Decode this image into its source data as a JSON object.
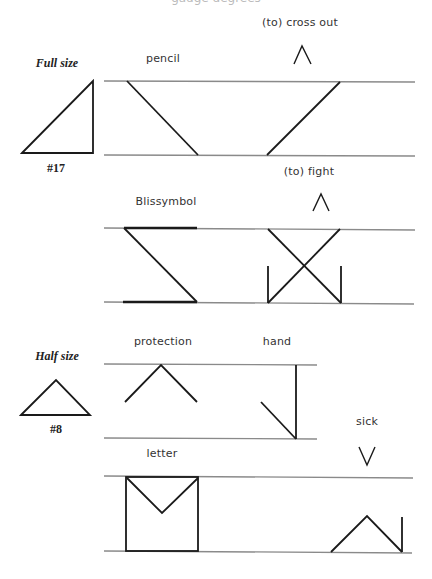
{
  "header": {
    "clipped_caption": "gauge degrees"
  },
  "sections": {
    "full_size": {
      "size_label": "Full size",
      "template_number": "#17",
      "examples": [
        {
          "label": "pencil",
          "indicator": ""
        },
        {
          "label": "(to) cross out",
          "indicator": "^"
        },
        {
          "label": "Blissymbol",
          "indicator": ""
        },
        {
          "label": "(to) fight",
          "indicator": "^"
        }
      ]
    },
    "half_size": {
      "size_label": "Half size",
      "template_number": "#8",
      "examples": [
        {
          "label": "protection",
          "indicator": ""
        },
        {
          "label": "hand",
          "indicator": ""
        },
        {
          "label": "letter",
          "indicator": ""
        },
        {
          "label": "sick",
          "indicator": "v"
        }
      ]
    }
  },
  "colors": {
    "guide_line": "#8a8a8a",
    "stroke": "#1a1a1a",
    "text": "#333333"
  }
}
